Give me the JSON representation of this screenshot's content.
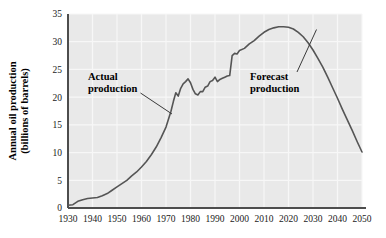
{
  "chart_data": {
    "type": "line",
    "title": "",
    "xlabel": "",
    "ylabel_line1": "Annual oil production",
    "ylabel_line2": "(billions of barrels)",
    "xlim": [
      1930,
      2050
    ],
    "ylim": [
      0,
      35
    ],
    "grid": true,
    "legend_position": "none",
    "xticks": [
      "1930",
      "1940",
      "1950",
      "1960",
      "1970",
      "1980",
      "1990",
      "2000",
      "2010",
      "2020",
      "2030",
      "2040",
      "2050"
    ],
    "yticks": [
      "0",
      "5",
      "10",
      "15",
      "20",
      "25",
      "30",
      "35"
    ],
    "annotations": [
      {
        "id": "actual",
        "line1": "Actual",
        "line2": "production",
        "x": 1946,
        "y": 25.2
      },
      {
        "id": "forecast",
        "line1": "Forecast",
        "line2": "production",
        "x": 2003,
        "y": 25.2
      }
    ],
    "series": [
      {
        "name": "Annual oil production",
        "color": "#555555",
        "x": [
          1930,
          1932,
          1934,
          1936,
          1938,
          1940,
          1942,
          1944,
          1946,
          1948,
          1950,
          1952,
          1954,
          1956,
          1958,
          1960,
          1962,
          1964,
          1966,
          1968,
          1970,
          1971,
          1972,
          1973,
          1974,
          1975,
          1976,
          1977,
          1978,
          1979,
          1980,
          1981,
          1982,
          1983,
          1984,
          1985,
          1986,
          1987,
          1988,
          1989,
          1990,
          1991,
          1992,
          1993,
          1994,
          1995,
          1996,
          1997,
          1998,
          1999,
          2000,
          2002,
          2004,
          2006,
          2008,
          2010,
          2012,
          2014,
          2016,
          2018,
          2020,
          2022,
          2024,
          2026,
          2028,
          2030,
          2032,
          2034,
          2036,
          2038,
          2040,
          2042,
          2044,
          2046,
          2048,
          2050
        ],
        "y": [
          0.5,
          0.6,
          1.2,
          1.5,
          1.7,
          1.8,
          1.9,
          2.2,
          2.6,
          3.2,
          3.8,
          4.4,
          5.0,
          5.8,
          6.5,
          7.4,
          8.4,
          9.6,
          11.0,
          12.7,
          14.6,
          16.0,
          17.4,
          19.2,
          20.8,
          20.2,
          21.6,
          22.4,
          22.8,
          23.3,
          22.6,
          21.4,
          20.6,
          20.4,
          21.0,
          21.0,
          21.8,
          22.0,
          22.8,
          23.0,
          23.6,
          22.8,
          23.2,
          23.4,
          23.6,
          23.8,
          23.9,
          27.5,
          27.9,
          27.8,
          28.4,
          28.8,
          29.6,
          30.2,
          31.0,
          31.7,
          32.2,
          32.5,
          32.7,
          32.7,
          32.6,
          32.3,
          31.7,
          30.9,
          29.8,
          28.5,
          27.0,
          25.4,
          23.6,
          21.7,
          19.8,
          17.8,
          15.9,
          14.0,
          12.0,
          10.1
        ]
      }
    ]
  },
  "style": {
    "plot_background": "#e9e9e9",
    "gridline_color": "#f7f7f7",
    "axis_color": "#4d4d4d",
    "curve_color": "#555555",
    "text_color": "#000000"
  }
}
